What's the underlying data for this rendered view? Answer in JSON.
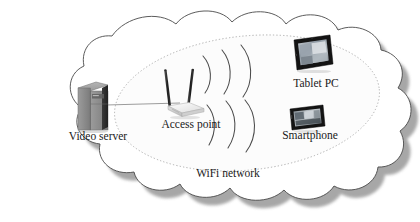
{
  "diagram": {
    "type": "network-topology",
    "background_color": "#ffffff",
    "cloud": {
      "name": "network-cloud",
      "stroke_color": "#4a4a4a",
      "fill_color": "#ffffff",
      "shadow_color": "#8c8c8c"
    },
    "wifi_zone": {
      "label": "WiFi network",
      "boundary_style": "dotted-ellipse",
      "boundary_color": "#9a9a9a",
      "fill_color": "#fbfbfb"
    },
    "nodes": [
      {
        "id": "video-server",
        "label": "Video server",
        "icon": "server-tower-icon",
        "x": 92,
        "y": 103,
        "label_x": 98,
        "label_y": 140,
        "color": "#8a8a8a"
      },
      {
        "id": "access-point",
        "label": "Access point",
        "icon": "wireless-router-icon",
        "x": 181,
        "y": 97,
        "label_x": 191,
        "label_y": 128,
        "color": "#e8e8e8"
      },
      {
        "id": "tablet-pc",
        "label": "Tablet PC",
        "icon": "tablet-icon",
        "x": 313,
        "y": 54,
        "label_x": 316,
        "label_y": 87,
        "color": "#1f1f1f"
      },
      {
        "id": "smartphone",
        "label": "Smartphone",
        "icon": "smartphone-icon",
        "x": 307,
        "y": 118,
        "label_x": 310,
        "label_y": 139,
        "color": "#1f1f1f"
      }
    ],
    "links": [
      {
        "id": "server-to-ap",
        "from": "video-server",
        "to": "access-point",
        "style": "solid-line",
        "color": "#9a9a9a"
      }
    ],
    "wifi_signals": {
      "name": "wifi-wave-arcs",
      "color": "#4a4a4a",
      "upper_group_count": 3,
      "lower_group_count": 3
    },
    "labels": {
      "video_server": "Video server",
      "access_point": "Access point",
      "tablet_pc": "Tablet PC",
      "smartphone": "Smartphone",
      "wifi_network": "WiFi network"
    },
    "label_positions": {
      "wifi_network_x": 228,
      "wifi_network_y": 177
    }
  }
}
